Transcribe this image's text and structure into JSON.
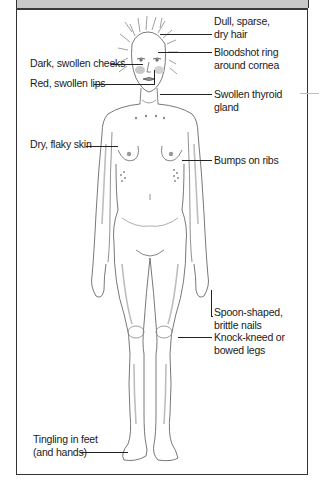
{
  "header": {
    "title": ""
  },
  "figure": {
    "colors": {
      "header_bg": "#c9c9c9",
      "frame": "#333333",
      "leader": "#222222",
      "figure_stroke": "#6e6e6e",
      "figure_shade": "#bdbdbd"
    }
  },
  "labels": {
    "right": [
      {
        "id": "hair",
        "lines": [
          "Dull, sparse,",
          "dry hair"
        ]
      },
      {
        "id": "eyes",
        "lines": [
          "Bloodshot ring",
          "around cornea"
        ]
      },
      {
        "id": "thyroid",
        "lines": [
          "Swollen thyroid",
          "gland"
        ]
      },
      {
        "id": "ribs",
        "lines": [
          "Bumps on ribs"
        ]
      },
      {
        "id": "nails",
        "lines": [
          "Spoon-shaped,",
          "brittle nails"
        ]
      },
      {
        "id": "legs",
        "lines": [
          "Knock-kneed or",
          "bowed legs"
        ]
      }
    ],
    "left": [
      {
        "id": "cheeks",
        "lines": [
          "Dark, swollen cheeks"
        ]
      },
      {
        "id": "lips",
        "lines": [
          "Red, swollen lips"
        ]
      },
      {
        "id": "skin",
        "lines": [
          "Dry, flaky skin"
        ]
      },
      {
        "id": "feet",
        "lines": [
          "Tingling in feet",
          "(and hands)"
        ]
      }
    ]
  }
}
